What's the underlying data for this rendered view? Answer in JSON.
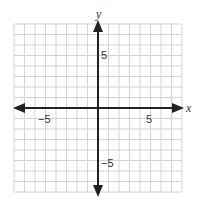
{
  "chart_data": {
    "type": "scatter",
    "title": "",
    "xlabel": "x",
    "ylabel": "y",
    "xlim": [
      -8,
      8
    ],
    "ylim": [
      -8,
      8
    ],
    "grid": true,
    "grid_step": 1,
    "x_tick_labels": [
      {
        "value": -5,
        "label": "−5"
      },
      {
        "value": 5,
        "label": "5"
      }
    ],
    "y_tick_labels": [
      {
        "value": 5,
        "label": "5"
      },
      {
        "value": -5,
        "label": "−5"
      }
    ],
    "series": [],
    "axes_arrows": true
  },
  "labels": {
    "x_axis": "x",
    "y_axis": "y",
    "x_neg5": "−5",
    "x_pos5": "5",
    "y_pos5": "5",
    "y_neg5": "−5"
  },
  "colors": {
    "grid": "#d4d4d4",
    "axis": "#222222",
    "text": "#333333"
  }
}
